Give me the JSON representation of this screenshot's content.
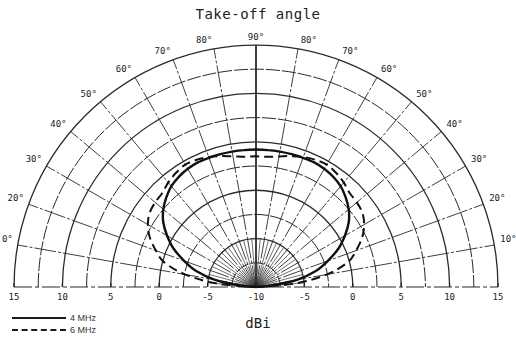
{
  "chart_data": {
    "type": "polar",
    "title": "Take-off angle",
    "xlabel": "dBi",
    "ylabel": "",
    "radial_range": [
      -10,
      15
    ],
    "radial_step": 2.5,
    "radial_tick_labels": [
      "15",
      "10",
      "5",
      "0",
      "-5",
      "-10",
      "-5",
      "0",
      "5",
      "10",
      "15"
    ],
    "angle_range_deg": [
      0,
      180
    ],
    "angle_step_deg": 10,
    "angle_tick_labels_left": [
      "0°",
      "20°",
      "30°",
      "40°",
      "50°",
      "60°",
      "70°",
      "80°"
    ],
    "angle_tick_labels_right": [
      "10°",
      "20°",
      "30°",
      "40°",
      "50°",
      "60°",
      "70°",
      "80°"
    ],
    "angle_tick_label_top": "90°",
    "grid": true,
    "legend_position": "bottom-left",
    "series": [
      {
        "name": "4 MHz",
        "style": "solid",
        "elevation_deg": [
          0,
          5,
          10,
          15,
          20,
          25,
          30,
          35,
          40,
          45,
          50,
          55,
          60,
          65,
          70,
          75,
          80,
          85,
          90
        ],
        "gain_dbi": [
          -10,
          -8.5,
          -5.7,
          -3.6,
          -2.1,
          -0.6,
          0.6,
          1.7,
          2.5,
          3.1,
          3.6,
          3.9,
          4.1,
          4.2,
          4.2,
          4.2,
          4.2,
          4.2,
          4.2
        ]
      },
      {
        "name": "6 MHz",
        "style": "dashed",
        "elevation_deg": [
          0,
          5,
          10,
          15,
          20,
          25,
          30,
          35,
          40,
          45,
          50,
          55,
          60,
          65,
          70,
          75,
          80,
          85,
          90
        ],
        "gain_dbi": [
          -10,
          -6.0,
          -2.6,
          -0.2,
          1.0,
          2.1,
          2.9,
          3.4,
          3.6,
          3.7,
          4.1,
          4.4,
          4.6,
          4.5,
          4.3,
          4.0,
          3.7,
          3.5,
          3.5
        ]
      }
    ]
  },
  "legend": {
    "items": [
      {
        "label": "4 MHz",
        "style": "solid"
      },
      {
        "label": "6 MHz",
        "style": "dashed"
      }
    ]
  }
}
